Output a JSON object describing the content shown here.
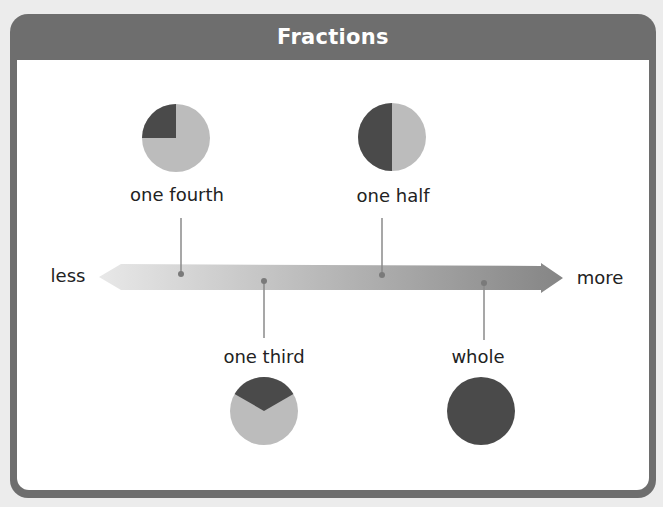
{
  "header": {
    "title": "Fractions"
  },
  "axis": {
    "left_label": "less",
    "right_label": "more",
    "gradient_start": "#e6e6e6",
    "gradient_end": "#8a8a8a"
  },
  "colors": {
    "frame": "#6e6e6e",
    "dark_fill": "#4a4a4a",
    "light_fill": "#bdbdbd",
    "connector": "#888888"
  },
  "fractions": [
    {
      "id": "one-fourth",
      "label": "one fourth",
      "value": 0.25,
      "position": "above"
    },
    {
      "id": "one-third",
      "label": "one third",
      "value": 0.3333,
      "position": "below"
    },
    {
      "id": "one-half",
      "label": "one half",
      "value": 0.5,
      "position": "above"
    },
    {
      "id": "whole",
      "label": "whole",
      "value": 1,
      "position": "below"
    }
  ]
}
